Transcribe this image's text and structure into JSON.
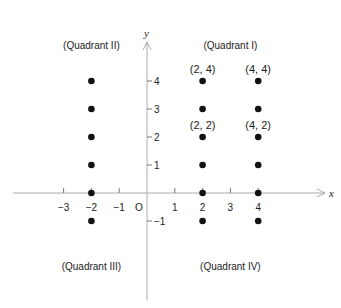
{
  "chart_data": {
    "type": "scatter",
    "title": "",
    "xlabel": "x",
    "ylabel": "y",
    "xlim": [
      -3.6,
      6.5
    ],
    "ylim": [
      -2.8,
      5.5
    ],
    "grid": false,
    "origin_label": "O",
    "x_ticks": [
      {
        "value": -3,
        "label": "−3"
      },
      {
        "value": -2,
        "label": "−2"
      },
      {
        "value": -1,
        "label": "−1"
      },
      {
        "value": 1,
        "label": "1"
      },
      {
        "value": 2,
        "label": "2"
      },
      {
        "value": 3,
        "label": "3"
      },
      {
        "value": 4,
        "label": "4"
      }
    ],
    "y_ticks": [
      {
        "value": 4,
        "label": "4"
      },
      {
        "value": 3,
        "label": "3"
      },
      {
        "value": 2,
        "label": "2"
      },
      {
        "value": 1,
        "label": "1"
      },
      {
        "value": -1,
        "label": "−1"
      }
    ],
    "points": [
      {
        "x": -2,
        "y": 4
      },
      {
        "x": -2,
        "y": 3
      },
      {
        "x": -2,
        "y": 2
      },
      {
        "x": -2,
        "y": 1
      },
      {
        "x": -2,
        "y": 0
      },
      {
        "x": -2,
        "y": -1
      },
      {
        "x": 2,
        "y": 4
      },
      {
        "x": 2,
        "y": 3
      },
      {
        "x": 2,
        "y": 2
      },
      {
        "x": 2,
        "y": 1
      },
      {
        "x": 2,
        "y": 0
      },
      {
        "x": 2,
        "y": -1
      },
      {
        "x": 4,
        "y": 4
      },
      {
        "x": 4,
        "y": 3
      },
      {
        "x": 4,
        "y": 2
      },
      {
        "x": 4,
        "y": 1
      },
      {
        "x": 4,
        "y": 0
      },
      {
        "x": 4,
        "y": -1
      }
    ],
    "point_labels": [
      {
        "x": 2,
        "y": 4,
        "label": "(2, 4)"
      },
      {
        "x": 4,
        "y": 4,
        "label": "(4, 4)"
      },
      {
        "x": 2,
        "y": 2,
        "label": "(2, 2)"
      },
      {
        "x": 4,
        "y": 2,
        "label": "(4, 2)"
      }
    ],
    "annotations": [
      {
        "label": "(Quadrant II)",
        "x": -2,
        "y": 5.3
      },
      {
        "label": "(Quadrant I)",
        "x": 3,
        "y": 5.3
      },
      {
        "label": "(Quadrant III)",
        "x": -2,
        "y": -2.6
      },
      {
        "label": "(Quadrant IV)",
        "x": 3,
        "y": -2.6
      }
    ]
  },
  "colors": {
    "axis": "#aaaaaa",
    "point": "#111111",
    "text": "#222222"
  }
}
